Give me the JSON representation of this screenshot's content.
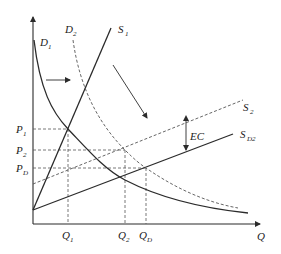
{
  "diagram": {
    "type": "supply-demand-externality",
    "axes": {
      "x_label": "Q",
      "y_label": ""
    },
    "price_levels": [
      {
        "label": "P",
        "sub": "1",
        "y": 129
      },
      {
        "label": "P",
        "sub": "2",
        "y": 150
      },
      {
        "label": "P",
        "sub": "D",
        "y": 168
      }
    ],
    "quantity_levels": [
      {
        "label": "Q",
        "sub": "1",
        "x": 68
      },
      {
        "label": "Q",
        "sub": "2",
        "x": 125
      },
      {
        "label": "Q",
        "sub": "D",
        "x": 146
      }
    ],
    "curves": {
      "D1": {
        "label": "D",
        "sub": "1",
        "style": "solid"
      },
      "D2": {
        "label": "D",
        "sub": "2",
        "style": "dashed"
      },
      "S1": {
        "label": "S",
        "sub": "1",
        "style": "solid"
      },
      "S2": {
        "label": "S",
        "sub": "2",
        "style": "dashed"
      },
      "SD2": {
        "label": "S",
        "sub": "D2",
        "style": "solid"
      }
    },
    "annotations": {
      "ec_label": "EC",
      "demand_shift_arrow": "right",
      "diagonal_arrow": "down-right"
    },
    "colors": {
      "line": "#2b2b2b",
      "dashed": "#555555",
      "background": "#ffffff"
    }
  }
}
